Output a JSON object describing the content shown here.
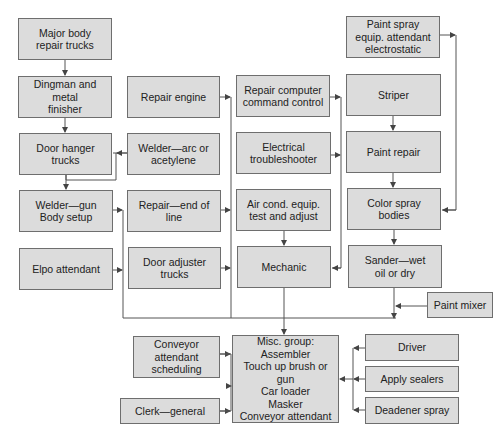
{
  "diagram": {
    "type": "flow/organization chart",
    "colors": {
      "box_fill": "#dcdcdc",
      "box_border": "#6e6e6e",
      "line": "#555555"
    },
    "nodes": [
      {
        "id": "major_body",
        "label": "Major body\nrepair trucks"
      },
      {
        "id": "dingman",
        "label": "Dingman and metal\nfinisher"
      },
      {
        "id": "door_hanger",
        "label": "Door hanger\ntrucks"
      },
      {
        "id": "welder_gun",
        "label": "Welder—gun\nBody setup"
      },
      {
        "id": "elpo",
        "label": "Elpo attendant"
      },
      {
        "id": "repair_engine",
        "label": "Repair engine"
      },
      {
        "id": "welder_arc",
        "label": "Welder—arc or\nacetylene"
      },
      {
        "id": "repair_eol",
        "label": "Repair—end of\nline"
      },
      {
        "id": "door_adjuster",
        "label": "Door adjuster\ntrucks"
      },
      {
        "id": "repair_computer",
        "label": "Repair computer\ncommand control"
      },
      {
        "id": "electrical",
        "label": "Electrical\ntroubleshooter"
      },
      {
        "id": "air_cond",
        "label": "Air cond. equip.\ntest and adjust"
      },
      {
        "id": "mechanic",
        "label": "Mechanic"
      },
      {
        "id": "paint_spray",
        "label": "Paint spray\nequip. attendant\nelectrostatic"
      },
      {
        "id": "striper",
        "label": "Striper"
      },
      {
        "id": "paint_repair",
        "label": "Paint repair"
      },
      {
        "id": "color_spray",
        "label": "Color spray\nbodies"
      },
      {
        "id": "sander",
        "label": "Sander—wet\noil or dry"
      },
      {
        "id": "paint_mixer",
        "label": "Paint mixer"
      },
      {
        "id": "conveyor_sched",
        "label": "Conveyor\nattendant\nscheduling"
      },
      {
        "id": "clerk",
        "label": "Clerk—general"
      },
      {
        "id": "misc",
        "label": "Misc. group:\nAssembler\nTouch up brush or gun\nCar loader\nMasker\nConveyor attendant"
      },
      {
        "id": "driver",
        "label": "Driver"
      },
      {
        "id": "sealers",
        "label": "Apply sealers"
      },
      {
        "id": "deadener",
        "label": "Deadener spray"
      }
    ],
    "edges": [
      [
        "major_body",
        "dingman"
      ],
      [
        "dingman",
        "door_hanger"
      ],
      [
        "welder_arc",
        "door_hanger"
      ],
      [
        "door_hanger",
        "welder_gun"
      ],
      [
        "welder_gun",
        "misc"
      ],
      [
        "elpo",
        "misc"
      ],
      [
        "repair_engine",
        "misc"
      ],
      [
        "repair_eol",
        "misc"
      ],
      [
        "door_adjuster",
        "misc"
      ],
      [
        "repair_computer",
        "mechanic"
      ],
      [
        "electrical",
        "mechanic"
      ],
      [
        "air_cond",
        "mechanic"
      ],
      [
        "mechanic",
        "misc"
      ],
      [
        "paint_spray",
        "color_spray"
      ],
      [
        "striper",
        "paint_repair"
      ],
      [
        "paint_repair",
        "color_spray"
      ],
      [
        "color_spray",
        "sander"
      ],
      [
        "sander",
        "misc"
      ],
      [
        "paint_mixer",
        "misc"
      ],
      [
        "conveyor_sched",
        "misc"
      ],
      [
        "clerk",
        "misc"
      ],
      [
        "driver",
        "misc"
      ],
      [
        "sealers",
        "misc"
      ],
      [
        "deadener",
        "misc"
      ]
    ]
  }
}
